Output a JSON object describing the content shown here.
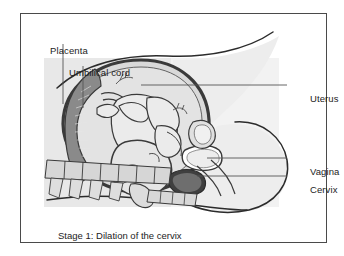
{
  "figure": {
    "caption": "Stage 1: Dilation of the cervix",
    "frame_color": "#4a4a4a",
    "background_color": "#ffffff",
    "body_tint_color": "#e8e8e8",
    "organ_fill_color": "#d4d4d4",
    "placenta_color": "#8a8a8a",
    "outline_color": "#2b2b2b",
    "leader_line_color": "#555555"
  },
  "labels": {
    "placenta": "Placenta",
    "umbilical_cord": "Umbilical cord",
    "uterus": "Uterus",
    "vagina": "Vagina",
    "cervix": "Cervix"
  }
}
